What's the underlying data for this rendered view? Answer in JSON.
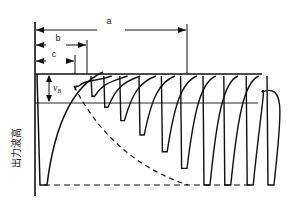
{
  "diagram": {
    "type": "pulse-pileup-waveform",
    "dimension_labels": {
      "a": "a",
      "b": "b",
      "c": "c"
    },
    "amplitude_label": {
      "symbol": "v",
      "subscript": "B"
    },
    "y_axis_label": "出力波高",
    "line_color": "#111111",
    "pulses": [
      {
        "drop_at": 0.0,
        "trough": 0.11
      },
      {
        "drop_at": 0.1,
        "trough": 0.2
      },
      {
        "drop_at": 0.18,
        "trough": 0.3
      },
      {
        "drop_at": 0.28,
        "trough": 0.42
      },
      {
        "drop_at": 0.4,
        "trough": 0.55
      },
      {
        "drop_at": 0.54,
        "trough": 0.7
      },
      {
        "drop_at": 0.66,
        "trough": 0.85
      },
      {
        "drop_at": 0.8,
        "trough": 1.0
      },
      {
        "drop_at": 0.93,
        "trough": 1.0
      },
      {
        "drop_at": 1.07,
        "trough": 1.0
      },
      {
        "drop_at": 1.2,
        "trough": 1.0
      }
    ]
  }
}
